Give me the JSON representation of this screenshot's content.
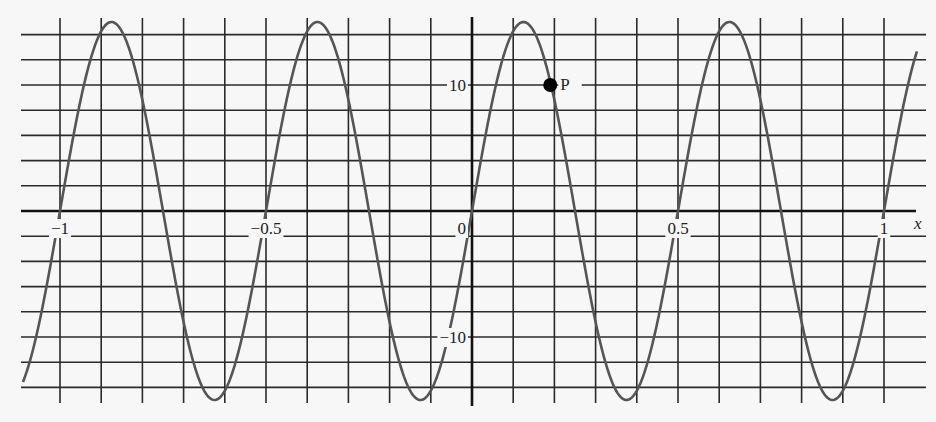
{
  "chart_data": {
    "type": "line",
    "title": "",
    "xlabel": "x",
    "ylabel": "",
    "function": "y = 15 sin(4πx)",
    "amplitude": 15,
    "period": 0.5,
    "xlim": [
      -1.09,
      1.08
    ],
    "ylim": [
      -17,
      17
    ],
    "grid": true,
    "grid_spacing": {
      "x": 0.1,
      "y": 2
    },
    "x_ticks": [
      {
        "value": -1,
        "label": "−1"
      },
      {
        "value": -0.5,
        "label": "−0.5"
      },
      {
        "value": 0,
        "label": "0"
      },
      {
        "value": 0.5,
        "label": "0.5"
      },
      {
        "value": 1,
        "label": "1"
      }
    ],
    "y_ticks": [
      {
        "value": 10,
        "label": "10"
      },
      {
        "value": -10,
        "label": "−10"
      }
    ],
    "series": [
      {
        "name": "curve",
        "x": [
          -1.09,
          -1.0,
          -0.875,
          -0.75,
          -0.625,
          -0.5,
          -0.375,
          -0.25,
          -0.125,
          0,
          0.125,
          0.25,
          0.375,
          0.5,
          0.625,
          0.75,
          0.875,
          1.0,
          1.08
        ],
        "values": [
          -13.7,
          0,
          15,
          0,
          -15,
          0,
          15,
          0,
          -15,
          0,
          15,
          0,
          -15,
          0,
          15,
          0,
          -15,
          0,
          12.9
        ]
      }
    ],
    "annotations": [
      {
        "label": "P",
        "x": 0.19,
        "y": 10,
        "marker": "filled-circle"
      }
    ]
  }
}
